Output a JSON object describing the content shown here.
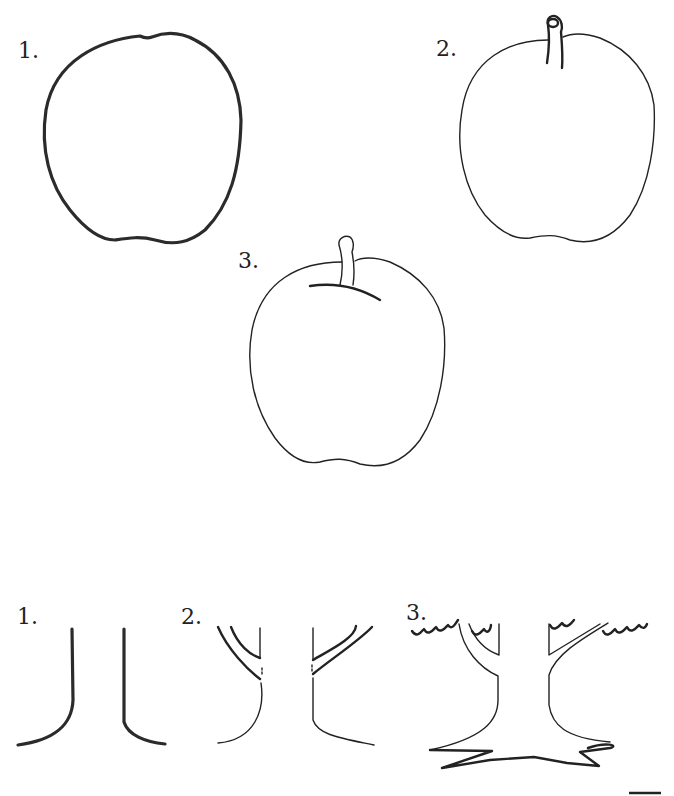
{
  "apple_section": {
    "steps": [
      {
        "label": "1.",
        "description": "apple outline"
      },
      {
        "label": "2.",
        "description": "apple outline with stem"
      },
      {
        "label": "3.",
        "description": "apple outline with stem and stem cavity line"
      }
    ]
  },
  "tree_section": {
    "steps": [
      {
        "label": "1.",
        "description": "trunk outline"
      },
      {
        "label": "2.",
        "description": "trunk with branches"
      },
      {
        "label": "3.",
        "description": "tree with canopy scallops and roots"
      }
    ]
  },
  "colors": {
    "line": "#222222",
    "background": "#ffffff"
  }
}
